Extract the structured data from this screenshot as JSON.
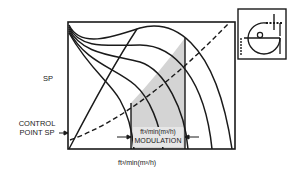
{
  "diagram": {
    "type": "fan-curve-modulation",
    "y_axis_label": "SP",
    "x_axis_label": "ft³/min(m³/h)",
    "control_point_label": [
      "CONTROL",
      "POINT SP"
    ],
    "modulation_box": {
      "units": "ft³/min(m³/h)",
      "label": "MODULATION"
    },
    "curves": {
      "fan_curves_count": 5,
      "system_curve_style": "dashed",
      "surge_line_style": "solid",
      "shaded_region": "modulation range"
    },
    "inset_icon": "fan-with-inlet-vanes-icon"
  }
}
